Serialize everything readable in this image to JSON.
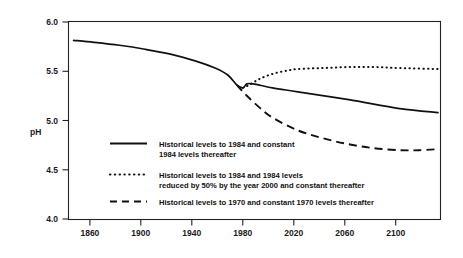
{
  "chart_data": {
    "type": "line",
    "title": "",
    "xlabel": "",
    "ylabel": "pH",
    "xlim": [
      1840,
      2132
    ],
    "ylim": [
      4.0,
      6.0
    ],
    "grid": false,
    "legend_position": "inside-center-left",
    "x_ticks": [
      "1860",
      "1900",
      "1940",
      "1980",
      "2020",
      "2060",
      "2100"
    ],
    "x_tick_values": [
      1860,
      1900,
      1940,
      1980,
      2020,
      2060,
      2100
    ],
    "y_ticks": [
      "4.0",
      "4.5",
      "5.0",
      "5.5",
      "6.0"
    ],
    "y_tick_values": [
      4.0,
      4.5,
      5.0,
      5.5,
      6.0
    ],
    "series": [
      {
        "name": "Historical levels to 1984 and constant 1984 levels thereafter",
        "style": "solid",
        "x": [
          1844,
          1860,
          1880,
          1900,
          1920,
          1940,
          1955,
          1965,
          1972,
          1977,
          1980,
          1985,
          2000,
          2020,
          2060,
          2100,
          2130
        ],
        "values": [
          5.81,
          5.79,
          5.76,
          5.72,
          5.67,
          5.6,
          5.53,
          5.46,
          5.36,
          5.33,
          5.37,
          5.37,
          5.33,
          5.29,
          5.21,
          5.12,
          5.08
        ]
      },
      {
        "name": "Historical levels to 1984 and 1984 levels reduced by 50% by the year 2000 and constant thereafter",
        "style": "dotted",
        "x": [
          1977,
          1982,
          1990,
          2000,
          2010,
          2020,
          2040,
          2060,
          2080,
          2100,
          2130
        ],
        "values": [
          5.33,
          5.36,
          5.42,
          5.47,
          5.5,
          5.52,
          5.53,
          5.54,
          5.54,
          5.53,
          5.52
        ]
      },
      {
        "name": "Historical levels to 1970 and constant 1970 levels thereafter",
        "style": "dashed",
        "x": [
          1972,
          1980,
          1990,
          2000,
          2020,
          2040,
          2060,
          2080,
          2100,
          2115,
          2130
        ],
        "values": [
          5.36,
          5.25,
          5.13,
          5.03,
          4.9,
          4.82,
          4.76,
          4.72,
          4.7,
          4.7,
          4.71
        ]
      }
    ]
  },
  "axes": {
    "y_title": "pH",
    "y_tick_labels": [
      "6.0",
      "5.5",
      "5.0",
      "4.5",
      "4.0"
    ],
    "x_tick_labels": [
      "1860",
      "1900",
      "1940",
      "1980",
      "2020",
      "2060",
      "2100"
    ]
  },
  "legend": {
    "entries": [
      {
        "style": "solid",
        "line1": "Historical levels to 1984 and constant",
        "line2": "1984 levels thereafter"
      },
      {
        "style": "dotted",
        "line1": "Historical levels to 1984 and 1984 levels",
        "line2": "reduced by 50% by the year 2000 and constant thereafter"
      },
      {
        "style": "dashed",
        "line1": "Historical levels to 1970 and constant 1970 levels thereafter",
        "line2": ""
      }
    ]
  }
}
